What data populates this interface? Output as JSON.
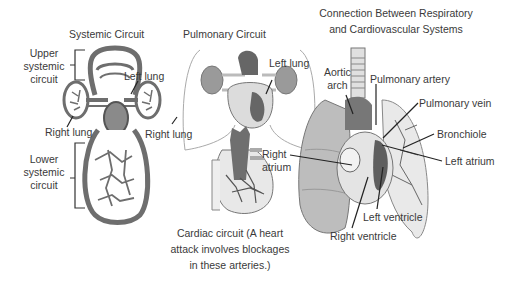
{
  "systemic": {
    "title": "Systemic Circuit",
    "upper_label": [
      "Upper",
      "systemic",
      "circuit"
    ],
    "lower_label": [
      "Lower",
      "systemic",
      "circuit"
    ],
    "left_lung": "Left lung",
    "right_lung": "Right lung"
  },
  "pulmonary": {
    "title": "Pulmonary Circuit",
    "left_lung": "Left lung",
    "right_lung": "Right lung"
  },
  "cardiac": {
    "caption": [
      "Cardiac circuit (A heart",
      "attack involves blockages",
      "in these arteries.)"
    ]
  },
  "connection": {
    "title": [
      "Connection Between Respiratory",
      "and Cardiovascular Systems"
    ],
    "labels": {
      "aortic_arch": [
        "Aortic",
        "arch"
      ],
      "pulmonary_artery": "Pulmonary artery",
      "pulmonary_vein": "Pulmonary vein",
      "bronchiole": "Bronchiole",
      "right_atrium": [
        "Right",
        "atrium"
      ],
      "left_atrium": "Left atrium",
      "left_ventricle": "Left ventricle",
      "right_ventricle": "Right ventricle"
    }
  },
  "colors": {
    "vessel": "#6e6e6e",
    "tissue_light": "#d9d9d9",
    "tissue_mid": "#a8a8a8",
    "tissue_dark": "#6a6a6a",
    "text": "#3a3a3a"
  }
}
